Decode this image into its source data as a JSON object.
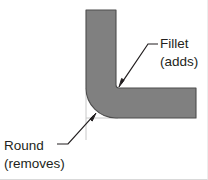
{
  "figure": {
    "background_color": "#ffffff",
    "border_color": "#d9d9d9"
  },
  "part": {
    "name": "L-bracket cross-section",
    "fill_color": "#808080",
    "outline_color": "#4d4d4d",
    "vertical_arm": {
      "x_left": 86,
      "x_right": 116,
      "y_top": 10
    },
    "horizontal_arm": {
      "x_right": 196,
      "y_bottom": 118
    },
    "corner_vertex": {
      "x": 116,
      "y": 88
    },
    "outer_round_radius": 30,
    "inner_fillet_radius": 3
  },
  "annotations": [
    {
      "id": "fillet",
      "label_line_1": "Fillet",
      "label_line_2": "(adds)",
      "label_x": 160,
      "label_y_1": 48,
      "label_y_2": 66,
      "leader_color": "#231f20",
      "arrow_tip": {
        "x": 119,
        "y": 87
      },
      "leader_elbow": {
        "x": 148,
        "y": 44
      },
      "leader_end": {
        "x": 158,
        "y": 44
      },
      "points_to": "inner-corner"
    },
    {
      "id": "round",
      "label_line_1": "Round",
      "label_line_2": "(removes)",
      "label_x": 4,
      "label_y_1": 150,
      "label_y_2": 168,
      "leader_color": "#231f20",
      "arrow_tip": {
        "x": 96,
        "y": 113
      },
      "leader_elbow": {
        "x": 68,
        "y": 144
      },
      "leader_end": {
        "x": 57,
        "y": 144
      },
      "points_to": "outer-round"
    }
  ],
  "construction_lines": {
    "color": "#c8c8c8",
    "vertical": {
      "x": 86,
      "y_top": 88,
      "y_bottom": 140
    },
    "horizontal": {
      "y": 118,
      "x_left": 86,
      "x_right": 116
    }
  }
}
